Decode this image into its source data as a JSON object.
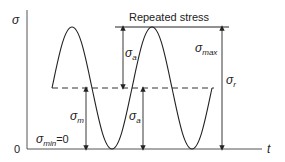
{
  "diagram": {
    "title": "Repeated stress",
    "axes": {
      "y_label": "σ",
      "x_label": "t",
      "origin_label": "0"
    },
    "labels": {
      "sigma_a_upper": {
        "symbol": "σ",
        "subscript": "a"
      },
      "sigma_a_lower": {
        "symbol": "σ",
        "subscript": "a"
      },
      "sigma_m": {
        "symbol": "σ",
        "subscript": "m"
      },
      "sigma_max": {
        "symbol": "σ",
        "subscript": "max"
      },
      "sigma_r": {
        "symbol": "σ",
        "subscript": "r"
      },
      "sigma_min": {
        "symbol": "σ",
        "subscript": "min",
        "suffix": "=0"
      }
    },
    "curve": {
      "type": "sine",
      "mean_line": "dashed",
      "min_value": 0
    },
    "colors": {
      "line": "#222222",
      "axis": "#555555",
      "background": "#ffffff"
    }
  }
}
